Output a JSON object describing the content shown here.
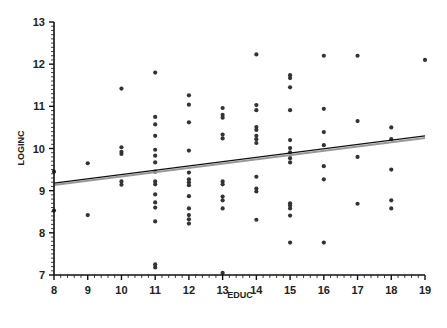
{
  "chart_data": {
    "type": "scatter",
    "title": "",
    "xlabel": "EDUC",
    "ylabel": "LOGINC",
    "xlim": [
      8,
      19
    ],
    "ylim": [
      7,
      13
    ],
    "xticks": [
      8,
      9,
      10,
      11,
      12,
      13,
      14,
      15,
      16,
      17,
      18,
      19
    ],
    "yticks": [
      7,
      8,
      9,
      10,
      11,
      12,
      13
    ],
    "grid": false,
    "legend": null,
    "points": [
      [
        8,
        9.45
      ],
      [
        8,
        8.53
      ],
      [
        9,
        9.65
      ],
      [
        9,
        8.42
      ],
      [
        10,
        11.42
      ],
      [
        10,
        10.03
      ],
      [
        10,
        9.92
      ],
      [
        10,
        9.87
      ],
      [
        10,
        9.22
      ],
      [
        10,
        9.14
      ],
      [
        11,
        11.8
      ],
      [
        11,
        10.75
      ],
      [
        11,
        10.57
      ],
      [
        11,
        10.3
      ],
      [
        11,
        9.97
      ],
      [
        11,
        9.83
      ],
      [
        11,
        9.67
      ],
      [
        11,
        9.45
      ],
      [
        11,
        9.22
      ],
      [
        11,
        9.15
      ],
      [
        11,
        8.91
      ],
      [
        11,
        8.72
      ],
      [
        11,
        8.6
      ],
      [
        11,
        8.27
      ],
      [
        11,
        7.25
      ],
      [
        11,
        7.18
      ],
      [
        12,
        11.26
      ],
      [
        12,
        11.04
      ],
      [
        12,
        10.62
      ],
      [
        12,
        9.95
      ],
      [
        12,
        9.43
      ],
      [
        12,
        9.27
      ],
      [
        12,
        9.2
      ],
      [
        12,
        9.13
      ],
      [
        12,
        8.87
      ],
      [
        12,
        8.58
      ],
      [
        12,
        8.42
      ],
      [
        12,
        8.32
      ],
      [
        12,
        8.22
      ],
      [
        13,
        10.96
      ],
      [
        13,
        10.8
      ],
      [
        13,
        10.73
      ],
      [
        13,
        10.33
      ],
      [
        13,
        10.24
      ],
      [
        13,
        9.22
      ],
      [
        13,
        9.15
      ],
      [
        13,
        8.86
      ],
      [
        13,
        8.77
      ],
      [
        13,
        8.58
      ],
      [
        13,
        7.05
      ],
      [
        14,
        12.23
      ],
      [
        14,
        11.03
      ],
      [
        14,
        10.91
      ],
      [
        14,
        10.51
      ],
      [
        14,
        10.44
      ],
      [
        14,
        10.3
      ],
      [
        14,
        10.22
      ],
      [
        14,
        10.13
      ],
      [
        14,
        9.33
      ],
      [
        14,
        9.05
      ],
      [
        14,
        8.98
      ],
      [
        14,
        8.31
      ],
      [
        15,
        11.74
      ],
      [
        15,
        11.67
      ],
      [
        15,
        11.45
      ],
      [
        15,
        10.91
      ],
      [
        15,
        10.2
      ],
      [
        15,
        10.01
      ],
      [
        15,
        9.91
      ],
      [
        15,
        9.77
      ],
      [
        15,
        9.67
      ],
      [
        15,
        8.7
      ],
      [
        15,
        8.65
      ],
      [
        15,
        8.58
      ],
      [
        15,
        8.41
      ],
      [
        15,
        7.77
      ],
      [
        16,
        12.2
      ],
      [
        16,
        10.94
      ],
      [
        16,
        10.39
      ],
      [
        16,
        10.08
      ],
      [
        16,
        9.58
      ],
      [
        16,
        9.27
      ],
      [
        16,
        7.77
      ],
      [
        17,
        12.2
      ],
      [
        17,
        10.65
      ],
      [
        17,
        9.8
      ],
      [
        17,
        8.69
      ],
      [
        18,
        10.5
      ],
      [
        18,
        10.22
      ],
      [
        18,
        9.5
      ],
      [
        18,
        8.77
      ],
      [
        18,
        8.58
      ],
      [
        19,
        12.1
      ]
    ],
    "regression_line": {
      "x": [
        8,
        19
      ],
      "y": [
        9.18,
        10.3
      ],
      "color": "#111111"
    },
    "regression_line_secondary": {
      "x": [
        8,
        19
      ],
      "y": [
        9.16,
        10.27
      ],
      "color": "#999999"
    },
    "point_color": "#333333"
  }
}
